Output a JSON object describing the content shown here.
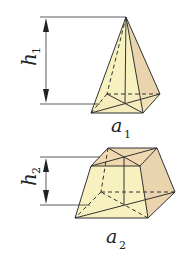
{
  "figure": {
    "pyramid": {
      "height_label": "h",
      "height_sub": "1",
      "base_label": "a",
      "base_sub": "1"
    },
    "frustum": {
      "height_label": "h",
      "height_sub": "2",
      "base_label": "a",
      "base_sub": "2"
    },
    "colors": {
      "front_face": "#f7f0b8",
      "side_face": "#e8d2ad",
      "top_face": "#f0d9b0",
      "edge": "#333333"
    }
  }
}
